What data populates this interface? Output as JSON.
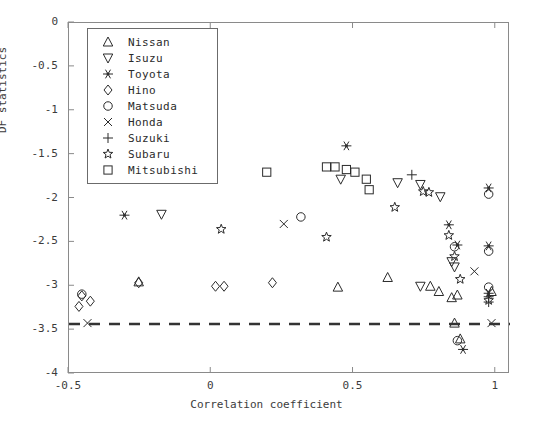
{
  "chart_data": {
    "type": "scatter",
    "title": "",
    "xlabel": "Correlation coefficient",
    "ylabel": "DF statistics",
    "xlim": [
      -0.5,
      1.05
    ],
    "ylim": [
      -4,
      0
    ],
    "xticks": [
      -0.5,
      0,
      0.5,
      1
    ],
    "xticklabels": [
      "-0.5",
      "0",
      "0.5",
      "1"
    ],
    "yticks": [
      0,
      -0.5,
      -1,
      -1.5,
      -2,
      -2.5,
      -3,
      -3.5,
      -4
    ],
    "yticklabels": [
      "0",
      "-0.5",
      "-1",
      "-1.5",
      "-2",
      "-2.5",
      "-3",
      "-3.5",
      "-4"
    ],
    "grid": false,
    "legend_position": "upper-left-inside",
    "threshold_line": {
      "y": -3.43,
      "style": "dashed",
      "color": "#333333"
    },
    "series": [
      {
        "name": "Nissan",
        "marker": "triangle-up",
        "points": [
          [
            -0.255,
            -2.95
          ],
          [
            0.445,
            -3.01
          ],
          [
            0.62,
            -2.9
          ],
          [
            0.77,
            -3.0
          ],
          [
            0.8,
            -3.06
          ],
          [
            0.845,
            -3.13
          ],
          [
            0.865,
            -3.1
          ],
          [
            0.855,
            -3.42
          ],
          [
            0.875,
            -3.6
          ],
          [
            0.985,
            -3.06
          ]
        ]
      },
      {
        "name": "Isuzu",
        "marker": "triangle-down",
        "points": [
          [
            -0.175,
            -2.18
          ],
          [
            0.455,
            -1.78
          ],
          [
            0.655,
            -1.82
          ],
          [
            0.735,
            -1.84
          ],
          [
            0.805,
            -1.98
          ],
          [
            0.845,
            -2.72
          ],
          [
            0.855,
            -2.78
          ],
          [
            0.735,
            -3.0
          ]
        ]
      },
      {
        "name": "Toyota",
        "marker": "asterisk",
        "points": [
          [
            -0.305,
            -2.19
          ],
          [
            0.475,
            -1.4
          ],
          [
            0.835,
            -2.3
          ],
          [
            0.865,
            -2.53
          ],
          [
            0.975,
            -1.88
          ],
          [
            0.975,
            -2.54
          ],
          [
            0.975,
            -3.08
          ],
          [
            0.885,
            -3.72
          ]
        ]
      },
      {
        "name": "Hino",
        "marker": "diamond",
        "points": [
          [
            -0.455,
            -3.11
          ],
          [
            -0.465,
            -3.23
          ],
          [
            -0.425,
            -3.17
          ],
          [
            -0.255,
            -2.96
          ],
          [
            0.015,
            -3.0
          ],
          [
            0.045,
            -3.0
          ],
          [
            0.215,
            -2.96
          ]
        ]
      },
      {
        "name": "Matsuda",
        "marker": "circle",
        "points": [
          [
            -0.455,
            -3.09
          ],
          [
            0.315,
            -2.21
          ],
          [
            0.855,
            -2.55
          ],
          [
            0.975,
            -2.6
          ],
          [
            0.975,
            -1.95
          ],
          [
            0.975,
            -3.01
          ],
          [
            0.865,
            -3.62
          ]
        ]
      },
      {
        "name": "Honda",
        "marker": "cross",
        "points": [
          [
            -0.435,
            -3.42
          ],
          [
            0.255,
            -2.29
          ],
          [
            0.925,
            -2.83
          ],
          [
            0.985,
            -3.42
          ]
        ]
      },
      {
        "name": "Suzuki",
        "marker": "plus",
        "points": [
          [
            0.705,
            -1.73
          ],
          [
            0.975,
            -3.12
          ],
          [
            0.975,
            -3.18
          ]
        ]
      },
      {
        "name": "Subaru",
        "marker": "star",
        "points": [
          [
            0.035,
            -2.35
          ],
          [
            0.405,
            -2.44
          ],
          [
            0.645,
            -2.1
          ],
          [
            0.745,
            -1.92
          ],
          [
            0.765,
            -1.93
          ],
          [
            0.835,
            -2.42
          ],
          [
            0.855,
            -2.66
          ],
          [
            0.875,
            -2.92
          ],
          [
            0.975,
            -3.16
          ]
        ]
      },
      {
        "name": "Mitsubishi",
        "marker": "square",
        "points": [
          [
            0.195,
            -1.7
          ],
          [
            0.405,
            -1.64
          ],
          [
            0.435,
            -1.64
          ],
          [
            0.475,
            -1.67
          ],
          [
            0.505,
            -1.7
          ],
          [
            0.545,
            -1.78
          ],
          [
            0.555,
            -1.9
          ]
        ]
      }
    ]
  },
  "legend": {
    "items": [
      {
        "label": "Nissan",
        "marker": "triangle-up"
      },
      {
        "label": "Isuzu",
        "marker": "triangle-down"
      },
      {
        "label": "Toyota",
        "marker": "asterisk"
      },
      {
        "label": "Hino",
        "marker": "diamond"
      },
      {
        "label": "Matsuda",
        "marker": "circle"
      },
      {
        "label": "Honda",
        "marker": "cross"
      },
      {
        "label": "Suzuki",
        "marker": "plus"
      },
      {
        "label": "Subaru",
        "marker": "star"
      },
      {
        "label": "Mitsubishi",
        "marker": "square"
      }
    ]
  },
  "colors": {
    "marker": "#2b2b2b",
    "frame": "#8a8a8a",
    "text": "#3c3c3c",
    "threshold": "#333333"
  }
}
